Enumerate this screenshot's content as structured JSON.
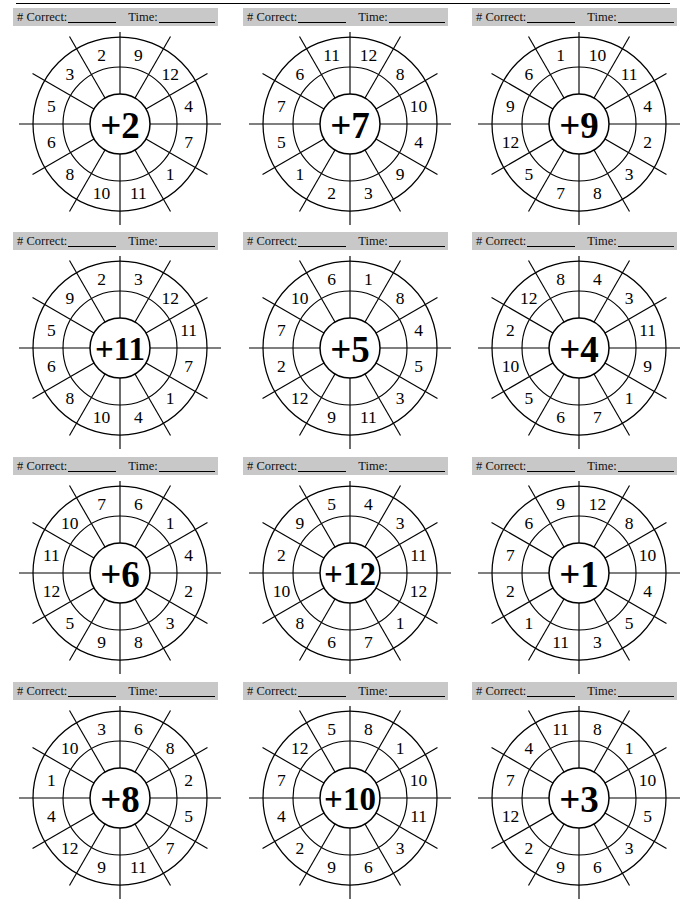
{
  "page": {
    "has_top_rule": true,
    "columns": 3,
    "rows": 4,
    "bar_color": "#c8c8c8",
    "ink_color": "#000000"
  },
  "score_bar": {
    "correct_label": "# Correct:",
    "time_label": "Time:"
  },
  "wheels": [
    {
      "id": "wheel-plus-2",
      "center_label": "+2",
      "operator": "+",
      "addend": 2,
      "outer_numbers": [
        9,
        12,
        4,
        7,
        1,
        11,
        10,
        8,
        6,
        5,
        3,
        2
      ]
    },
    {
      "id": "wheel-plus-7",
      "center_label": "+7",
      "operator": "+",
      "addend": 7,
      "outer_numbers": [
        12,
        8,
        10,
        4,
        9,
        3,
        2,
        1,
        5,
        7,
        6,
        11
      ]
    },
    {
      "id": "wheel-plus-9",
      "center_label": "+9",
      "operator": "+",
      "addend": 9,
      "outer_numbers": [
        10,
        11,
        4,
        2,
        3,
        8,
        7,
        5,
        12,
        9,
        6,
        1
      ]
    },
    {
      "id": "wheel-plus-11",
      "center_label": "+11",
      "operator": "+",
      "addend": 11,
      "outer_numbers": [
        3,
        12,
        11,
        7,
        1,
        4,
        10,
        8,
        6,
        5,
        9,
        2
      ]
    },
    {
      "id": "wheel-plus-5",
      "center_label": "+5",
      "operator": "+",
      "addend": 5,
      "outer_numbers": [
        1,
        8,
        4,
        5,
        3,
        11,
        9,
        12,
        2,
        7,
        10,
        6
      ]
    },
    {
      "id": "wheel-plus-4",
      "center_label": "+4",
      "operator": "+",
      "addend": 4,
      "outer_numbers": [
        4,
        3,
        11,
        9,
        1,
        7,
        6,
        5,
        10,
        2,
        12,
        8
      ]
    },
    {
      "id": "wheel-plus-6",
      "center_label": "+6",
      "operator": "+",
      "addend": 6,
      "outer_numbers": [
        6,
        1,
        4,
        2,
        3,
        8,
        9,
        5,
        12,
        11,
        10,
        7
      ]
    },
    {
      "id": "wheel-plus-12",
      "center_label": "+12",
      "operator": "+",
      "addend": 12,
      "outer_numbers": [
        4,
        3,
        11,
        12,
        1,
        7,
        6,
        8,
        10,
        2,
        9,
        5
      ]
    },
    {
      "id": "wheel-plus-1",
      "center_label": "+1",
      "operator": "+",
      "addend": 1,
      "outer_numbers": [
        12,
        8,
        10,
        4,
        5,
        3,
        11,
        1,
        2,
        7,
        6,
        9
      ]
    },
    {
      "id": "wheel-plus-8",
      "center_label": "+8",
      "operator": "+",
      "addend": 8,
      "outer_numbers": [
        6,
        8,
        2,
        5,
        7,
        11,
        9,
        12,
        4,
        1,
        10,
        3
      ]
    },
    {
      "id": "wheel-plus-10",
      "center_label": "+10",
      "operator": "+",
      "addend": 10,
      "outer_numbers": [
        8,
        1,
        10,
        11,
        3,
        6,
        9,
        2,
        4,
        7,
        12,
        5
      ]
    },
    {
      "id": "wheel-plus-3",
      "center_label": "+3",
      "operator": "+",
      "addend": 3,
      "outer_numbers": [
        8,
        1,
        10,
        5,
        3,
        6,
        9,
        2,
        12,
        7,
        4,
        11
      ]
    }
  ]
}
